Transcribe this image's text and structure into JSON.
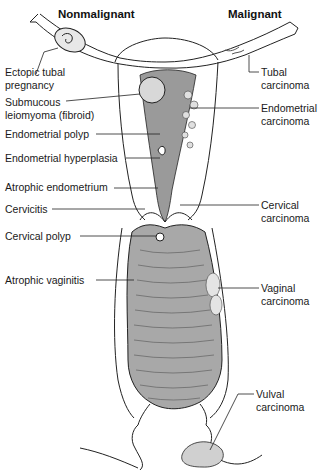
{
  "headers": {
    "left": "Nonmalignant",
    "right": "Malignant"
  },
  "labels_left": [
    {
      "line1": "Ectopic tubal",
      "line2": "pregnancy"
    },
    {
      "line1": "Submucous",
      "line2": "leiomyoma (fibroid)"
    },
    {
      "line1": "Endometrial polyp"
    },
    {
      "line1": "Endometrial hyperplasia"
    },
    {
      "line1": "Atrophic endometrium"
    },
    {
      "line1": "Cervicitis"
    },
    {
      "line1": "Cervical polyp"
    },
    {
      "line1": "Atrophic vaginitis"
    }
  ],
  "labels_right": [
    {
      "line1": "Tubal",
      "line2": "carcinoma"
    },
    {
      "line1": "Endometrial",
      "line2": "carcinoma"
    },
    {
      "line1": "Cervical",
      "line2": "carcinoma"
    },
    {
      "line1": "Vaginal",
      "line2": "carcinoma"
    },
    {
      "line1": "Vulval",
      "line2": "carcinoma"
    }
  ],
  "colors": {
    "tissue_fill": "#b8b8b8",
    "outline": "#222222",
    "background": "#ffffff"
  }
}
